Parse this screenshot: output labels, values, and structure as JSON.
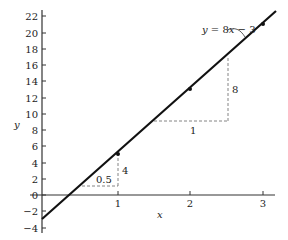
{
  "chart_data": {
    "type": "line",
    "title": "",
    "xlabel": "x",
    "ylabel": "y",
    "xlim": [
      0,
      3.2
    ],
    "ylim": [
      -4,
      22.5
    ],
    "x_ticks": [
      "1",
      "2",
      "3"
    ],
    "y_ticks": [
      "22",
      "20",
      "18",
      "16",
      "14",
      "12",
      "10",
      "8",
      "6",
      "4",
      "2",
      "0",
      "−2",
      "−4"
    ],
    "grid": false,
    "series": [
      {
        "name": "y = 8x − 3",
        "equation": "y = 8x - 3",
        "x": [
          0,
          1,
          2,
          3
        ],
        "y": [
          -3,
          5,
          13,
          21
        ]
      }
    ],
    "annotations": [
      {
        "label": "y = 8x − 3",
        "type": "equation-callout"
      },
      {
        "run_label": "0.5",
        "rise_label": "4",
        "run": [
          0.5,
          1
        ],
        "rise": [
          1,
          5
        ],
        "type": "slope-triangle"
      },
      {
        "run_label": "1",
        "rise_label": "8",
        "run": [
          1.5,
          2.5
        ],
        "rise": [
          9,
          17
        ],
        "type": "slope-triangle"
      }
    ]
  },
  "labels": {
    "x_axis": "x",
    "y_axis": "y",
    "equation_prefix": "y",
    "equation_mid": " = 8",
    "equation_var": "x",
    "equation_suffix": " − 3",
    "small_run": "0.5",
    "small_rise": "4",
    "large_run": "1",
    "large_rise": "8"
  },
  "ticks": {
    "y": [
      {
        "label": "22",
        "py": 16
      },
      {
        "label": "20",
        "py": 33
      },
      {
        "label": "18",
        "py": 49
      },
      {
        "label": "16",
        "py": 65
      },
      {
        "label": "14",
        "py": 81
      },
      {
        "label": "12",
        "py": 98
      },
      {
        "label": "10",
        "py": 114
      },
      {
        "label": "8",
        "py": 130
      },
      {
        "label": "6",
        "py": 146
      },
      {
        "label": "4",
        "py": 163
      },
      {
        "label": "2",
        "py": 179
      },
      {
        "label": "0",
        "py": 195
      },
      {
        "label": "−2",
        "py": 211
      },
      {
        "label": "−4",
        "py": 228
      }
    ],
    "x": [
      {
        "label": "1",
        "px": 118
      },
      {
        "label": "2",
        "px": 190
      },
      {
        "label": "3",
        "px": 263
      }
    ]
  }
}
